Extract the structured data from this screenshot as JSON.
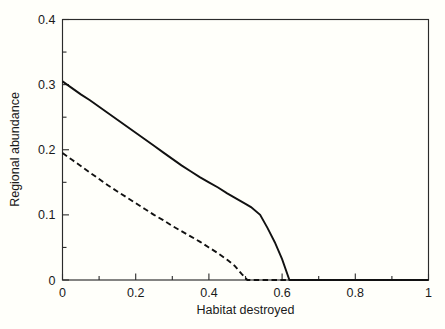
{
  "chart_data": {
    "type": "line",
    "title": "",
    "xlabel": "Habitat destroyed",
    "ylabel": "Regional abundance",
    "xlim": [
      0,
      1
    ],
    "ylim": [
      0,
      0.4
    ],
    "grid": false,
    "legend": "none",
    "x_ticks": [
      0,
      0.2,
      0.4,
      0.6,
      0.8,
      1
    ],
    "x_tick_labels": [
      "0",
      "0.2",
      "0.4",
      "0.6",
      "0.8",
      "1"
    ],
    "x_minor_ticks": [
      0.1,
      0.3,
      0.5,
      0.7,
      0.9
    ],
    "y_ticks": [
      0,
      0.1,
      0.2,
      0.3,
      0.4
    ],
    "y_tick_labels": [
      "0",
      "0.1",
      "0.2",
      "0.3",
      "0.4"
    ],
    "y_minor_ticks": [
      0.05,
      0.15,
      0.25,
      0.35
    ],
    "series": [
      {
        "name": "solid-curve",
        "style": "solid",
        "color": "#111111",
        "points": [
          [
            0.0,
            0.305
          ],
          [
            0.025,
            0.295
          ],
          [
            0.05,
            0.285
          ],
          [
            0.075,
            0.276
          ],
          [
            0.1,
            0.266
          ],
          [
            0.125,
            0.256
          ],
          [
            0.15,
            0.246
          ],
          [
            0.175,
            0.236
          ],
          [
            0.2,
            0.226
          ],
          [
            0.225,
            0.216
          ],
          [
            0.25,
            0.206
          ],
          [
            0.275,
            0.196
          ],
          [
            0.3,
            0.186
          ],
          [
            0.325,
            0.176
          ],
          [
            0.35,
            0.167
          ],
          [
            0.375,
            0.158
          ],
          [
            0.4,
            0.15
          ],
          [
            0.425,
            0.142
          ],
          [
            0.45,
            0.133
          ],
          [
            0.475,
            0.125
          ],
          [
            0.5,
            0.117
          ],
          [
            0.515,
            0.112
          ],
          [
            0.54,
            0.1
          ],
          [
            0.56,
            0.08
          ],
          [
            0.58,
            0.058
          ],
          [
            0.6,
            0.032
          ],
          [
            0.62,
            0.0
          ],
          [
            0.7,
            0.0
          ],
          [
            0.8,
            0.0
          ],
          [
            0.9,
            0.0
          ],
          [
            1.0,
            0.0
          ]
        ]
      },
      {
        "name": "dashed-curve",
        "style": "dashed",
        "color": "#111111",
        "points": [
          [
            0.0,
            0.195
          ],
          [
            0.025,
            0.185
          ],
          [
            0.05,
            0.175
          ],
          [
            0.075,
            0.165
          ],
          [
            0.1,
            0.155
          ],
          [
            0.125,
            0.145
          ],
          [
            0.15,
            0.136
          ],
          [
            0.175,
            0.127
          ],
          [
            0.2,
            0.118
          ],
          [
            0.225,
            0.109
          ],
          [
            0.25,
            0.1
          ],
          [
            0.275,
            0.092
          ],
          [
            0.3,
            0.083
          ],
          [
            0.325,
            0.075
          ],
          [
            0.35,
            0.067
          ],
          [
            0.375,
            0.059
          ],
          [
            0.4,
            0.05
          ],
          [
            0.425,
            0.041
          ],
          [
            0.45,
            0.031
          ],
          [
            0.47,
            0.022
          ],
          [
            0.49,
            0.009
          ],
          [
            0.505,
            0.0
          ],
          [
            0.6,
            0.0
          ],
          [
            0.7,
            0.0
          ],
          [
            0.8,
            0.0
          ],
          [
            0.9,
            0.0
          ],
          [
            1.0,
            0.0
          ]
        ]
      }
    ]
  },
  "axes": {
    "x_title": "Habitat destroyed",
    "y_title": "Regional abundance",
    "x_labels": [
      "0",
      "0.2",
      "0.4",
      "0.6",
      "0.8",
      "1"
    ],
    "y_labels": [
      "0",
      "0.1",
      "0.2",
      "0.3",
      "0.4"
    ]
  },
  "colors": {
    "background": "#fffffa",
    "axis": "#2b2b2b",
    "series": "#111111",
    "text": "#1a1a1a"
  }
}
